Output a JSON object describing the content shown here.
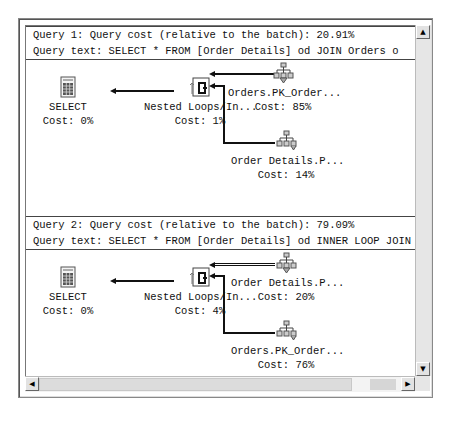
{
  "queries": [
    {
      "cost_line": "Query 1: Query cost (relative to the batch): 20.91%",
      "text_line": "Query text: SELECT *  FROM [Order Details] od JOIN Orders o",
      "nodes": {
        "select": {
          "label": "SELECT",
          "cost": "Cost: 0%",
          "icon": "select-icon"
        },
        "join": {
          "label": "Nested Loops/In...",
          "cost": "Cost: 1%",
          "icon": "nested-loops-icon"
        },
        "outer": {
          "label": "Orders.PK_Order...",
          "cost": "Cost: 85%",
          "icon": "index-seek-icon"
        },
        "inner": {
          "label": "Order Details.P...",
          "cost": "Cost: 14%",
          "icon": "index-scan-icon"
        }
      }
    },
    {
      "cost_line": "Query 2: Query cost (relative to the batch): 79.09%",
      "text_line": "Query text: SELECT *  FROM [Order Details] od INNER LOOP JOIN",
      "nodes": {
        "select": {
          "label": "SELECT",
          "cost": "Cost: 0%",
          "icon": "select-icon"
        },
        "join": {
          "label": "Nested Loops/In...",
          "cost": "Cost: 4%",
          "icon": "nested-loops-icon"
        },
        "outer": {
          "label": "Order Details.P...",
          "cost": "Cost: 20%",
          "icon": "index-scan-icon"
        },
        "inner": {
          "label": "Orders.PK_Order...",
          "cost": "Cost: 76%",
          "icon": "index-seek-icon"
        }
      }
    }
  ],
  "scrollbars": {
    "up": "▲",
    "down": "▼",
    "left": "◀",
    "right": "▶"
  }
}
